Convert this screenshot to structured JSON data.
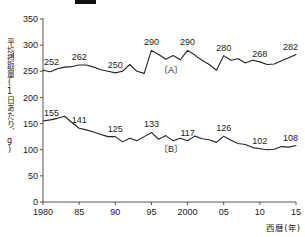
{
  "header": {
    "mark_label": "black-bar-mark"
  },
  "chart_data": {
    "type": "line",
    "title": "",
    "xlabel": "西暦(年)",
    "ylabel": "平均摂取量(1日あたり、g)",
    "xlim": [
      1980,
      2015
    ],
    "ylim": [
      0,
      350
    ],
    "grid": false,
    "legend_position": "inline",
    "xticks": [
      "1980",
      "85",
      "90",
      "95",
      "2000",
      "05",
      "10",
      "15"
    ],
    "xtick_values": [
      1980,
      1985,
      1990,
      1995,
      2000,
      2005,
      2010,
      2015
    ],
    "yticks": [
      "0",
      "50",
      "100",
      "150",
      "200",
      "250",
      "300",
      "350"
    ],
    "ytick_values": [
      0,
      50,
      100,
      150,
      200,
      250,
      300,
      350
    ],
    "series": [
      {
        "name": "(A)",
        "label": "〔A〕",
        "color": "#222222",
        "x": [
          1980,
          1981,
          1982,
          1983,
          1984,
          1985,
          1986,
          1987,
          1988,
          1989,
          1990,
          1991,
          1992,
          1993,
          1994,
          1995,
          1996,
          1997,
          1998,
          1999,
          2000,
          2001,
          2002,
          2003,
          2004,
          2005,
          2006,
          2007,
          2008,
          2009,
          2010,
          2011,
          2012,
          2013,
          2014,
          2015
        ],
        "values": [
          252,
          249,
          255,
          258,
          259,
          262,
          262,
          258,
          253,
          250,
          247,
          250,
          263,
          250,
          246,
          290,
          282,
          273,
          280,
          272,
          290,
          281,
          271,
          263,
          252,
          280,
          271,
          274,
          266,
          271,
          268,
          263,
          264,
          270,
          276,
          282
        ],
        "point_labels": [
          {
            "x": 1980,
            "value": 252
          },
          {
            "x": 1985,
            "value": 262
          },
          {
            "x": 1990,
            "value": 250
          },
          {
            "x": 1995,
            "value": 290
          },
          {
            "x": 2000,
            "value": 290
          },
          {
            "x": 2005,
            "value": 280
          },
          {
            "x": 2010,
            "value": 268
          },
          {
            "x": 2015,
            "value": 282
          }
        ]
      },
      {
        "name": "(B)",
        "label": "〔B〕",
        "color": "#222222",
        "x": [
          1980,
          1981,
          1982,
          1983,
          1984,
          1985,
          1986,
          1987,
          1988,
          1989,
          1990,
          1991,
          1992,
          1993,
          1994,
          1995,
          1996,
          1997,
          1998,
          1999,
          2000,
          2001,
          2002,
          2003,
          2004,
          2005,
          2006,
          2007,
          2008,
          2009,
          2010,
          2011,
          2012,
          2013,
          2014,
          2015
        ],
        "values": [
          155,
          157,
          160,
          164,
          152,
          141,
          138,
          134,
          129,
          125,
          125,
          115,
          122,
          117,
          125,
          133,
          120,
          127,
          117,
          122,
          117,
          126,
          121,
          119,
          114,
          126,
          118,
          112,
          110,
          104,
          102,
          100,
          101,
          106,
          105,
          108
        ],
        "point_labels": [
          {
            "x": 1980,
            "value": 155
          },
          {
            "x": 1985,
            "value": 141
          },
          {
            "x": 1990,
            "value": 125
          },
          {
            "x": 1995,
            "value": 133
          },
          {
            "x": 2000,
            "value": 117
          },
          {
            "x": 2005,
            "value": 126
          },
          {
            "x": 2010,
            "value": 102
          },
          {
            "x": 2015,
            "value": 108
          }
        ]
      }
    ]
  }
}
